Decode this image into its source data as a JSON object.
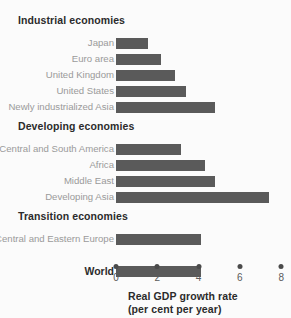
{
  "chart_data": {
    "type": "bar",
    "orientation": "horizontal",
    "title": "",
    "xlabel": "Real GDP growth rate",
    "xlabel_line2": "(per cent per year)",
    "ylabel": "",
    "xlim": [
      0,
      8.6
    ],
    "xticks": [
      0,
      2,
      4,
      6,
      8
    ],
    "xtick_labels": [
      "0",
      "2",
      "4",
      "6",
      "8"
    ],
    "grid": false,
    "legend": false,
    "bar_color": "#5a5a5a",
    "groups": [
      {
        "header": "Industrial economies",
        "categories": [
          "Japan",
          "Euro area",
          "United Kingdom",
          "United States",
          "Newly industrialized Asia"
        ],
        "values": [
          1.55,
          2.2,
          2.85,
          3.4,
          4.8
        ]
      },
      {
        "header": "Developing economies",
        "categories": [
          "Central and South America",
          "Africa",
          "Middle East",
          "Developing Asia"
        ],
        "values": [
          3.15,
          4.3,
          4.8,
          7.4
        ]
      },
      {
        "header": "Transition economies",
        "categories": [
          "Central and Eastern Europe"
        ],
        "values": [
          4.1
        ]
      },
      {
        "header": "",
        "categories": [
          "World"
        ],
        "values": [
          4.1
        ],
        "emphasis": true
      }
    ],
    "categories": [
      "Japan",
      "Euro area",
      "United Kingdom",
      "United States",
      "Newly industrialized Asia",
      "Central and South America",
      "Africa",
      "Middle East",
      "Developing Asia",
      "Central and Eastern Europe",
      "World"
    ],
    "values": [
      1.55,
      2.2,
      2.85,
      3.4,
      4.8,
      3.15,
      4.3,
      4.8,
      7.4,
      4.1,
      4.1
    ]
  }
}
